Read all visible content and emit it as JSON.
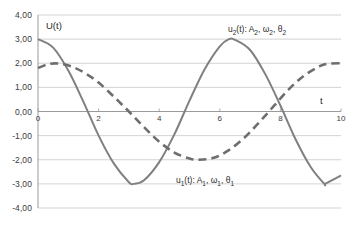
{
  "chart_data": {
    "type": "line",
    "title": "",
    "xlabel": "t",
    "ylabel": "U(t)",
    "xlim": [
      0,
      10
    ],
    "ylim": [
      -4,
      4
    ],
    "grid": true,
    "grid_axis": "y",
    "legend_position": "inline-annotations",
    "x_ticks": [
      "0",
      "2",
      "4",
      "6",
      "8",
      "10"
    ],
    "x_tick_values": [
      0,
      2,
      4,
      6,
      8,
      10
    ],
    "y_ticks": [
      "4,00",
      "3,00",
      "2,00",
      "1,00",
      "0,00",
      "-1,00",
      "-2,00",
      "-3,00",
      "-4,00"
    ],
    "y_tick_values": [
      4,
      3,
      2,
      1,
      0,
      -1,
      -2,
      -3,
      -4
    ],
    "series": [
      {
        "name": "u_2",
        "label_plain": "u2(t): A2, ω2, θ2",
        "style": "solid",
        "color": "#808080",
        "amplitude": 3.0,
        "period": 6.3,
        "phase_deg": 90,
        "formula": "3*cos(2*pi*t/6.3)",
        "points_x": [
          0,
          0.5,
          1,
          1.5,
          2,
          2.5,
          3,
          3.15,
          3.5,
          4,
          4.5,
          5,
          5.5,
          6,
          6.3,
          6.5,
          7,
          7.5,
          8,
          8.5,
          9,
          9.45,
          9.5,
          10
        ],
        "points_y": [
          3.0,
          2.65,
          1.7,
          0.4,
          -1.0,
          -2.15,
          -2.93,
          -3.0,
          -2.85,
          -2.1,
          -0.95,
          0.45,
          1.75,
          2.7,
          3.0,
          2.97,
          2.55,
          1.55,
          0.25,
          -1.15,
          -2.3,
          -3.0,
          -2.98,
          -2.65
        ]
      },
      {
        "name": "u_1",
        "label_plain": "u1(t): A1, ω1, θ1",
        "style": "dashed",
        "color": "#6e6e6e",
        "amplitude": 2.0,
        "period": 10.2,
        "phase_deg": 64,
        "formula": "2*cos(2*pi*(t-0.35)/10.2 - 1.1)",
        "points_x": [
          0,
          0.4,
          0.8,
          1.2,
          1.6,
          2,
          2.5,
          3,
          3.5,
          4,
          4.5,
          5,
          5.3,
          5.8,
          6.3,
          6.8,
          7.3,
          7.8,
          8.3,
          8.8,
          9.3,
          9.6,
          10
        ],
        "points_y": [
          1.8,
          1.98,
          1.97,
          1.82,
          1.55,
          1.2,
          0.62,
          0.0,
          -0.65,
          -1.25,
          -1.7,
          -1.95,
          -2.0,
          -1.92,
          -1.6,
          -1.1,
          -0.45,
          0.25,
          0.95,
          1.5,
          1.88,
          1.98,
          2.0
        ]
      }
    ],
    "annotations": [
      {
        "text_parts": {
          "pre": "u",
          "sub": "2",
          "post": "(t): A"
        },
        "full": "u2(t): A2, ω2, θ2"
      },
      {
        "text_parts": {
          "pre": "u",
          "sub": "1",
          "post": "(t): A"
        },
        "full": "u1(t): A1, ω1, θ1"
      }
    ]
  },
  "labels": {
    "y_axis_name": "U(t)",
    "x_axis_name": "t",
    "series2": {
      "var": "u",
      "var_sub": "2",
      "of_t": "(t): A",
      "a_sub": "2",
      "comma1": ", ",
      "omega": "ω",
      "omega_sub": "2",
      "comma2": ", ",
      "theta": "θ",
      "theta_sub": "2"
    },
    "series1": {
      "var": "u",
      "var_sub": "1",
      "of_t": "(t): A",
      "a_sub": "1",
      "comma1": ", ",
      "omega": "ω",
      "omega_sub": "1",
      "comma2": ", ",
      "theta": "θ",
      "theta_sub": "1"
    }
  },
  "style": {
    "grid_color": "#c8c8c8",
    "axis_color": "#9a9a9a",
    "solid_color": "#808080",
    "dashed_color": "#6e6e6e",
    "background": "#ffffff"
  }
}
